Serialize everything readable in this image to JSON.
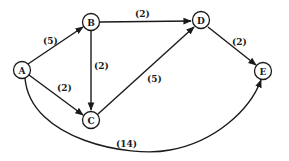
{
  "diagram": {
    "type": "weighted-directed-graph",
    "nodes": [
      {
        "id": "A",
        "label": "A",
        "x": 22,
        "y": 70
      },
      {
        "id": "B",
        "label": "B",
        "x": 91,
        "y": 22
      },
      {
        "id": "C",
        "label": "C",
        "x": 91,
        "y": 120
      },
      {
        "id": "D",
        "label": "D",
        "x": 201,
        "y": 20
      },
      {
        "id": "E",
        "label": "E",
        "x": 263,
        "y": 71
      }
    ],
    "edges": [
      {
        "from": "A",
        "to": "B",
        "weight": "(5)"
      },
      {
        "from": "A",
        "to": "C",
        "weight": "(2)"
      },
      {
        "from": "B",
        "to": "D",
        "weight": "(2)"
      },
      {
        "from": "B",
        "to": "C",
        "weight": "(2)"
      },
      {
        "from": "C",
        "to": "D",
        "weight": "(5)"
      },
      {
        "from": "D",
        "to": "E",
        "weight": "(2)"
      },
      {
        "from": "A",
        "to": "E",
        "weight": "(14)"
      }
    ]
  }
}
